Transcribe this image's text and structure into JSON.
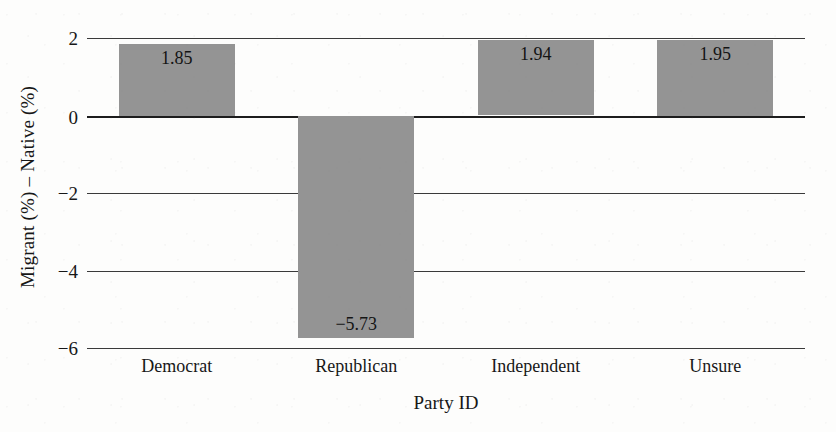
{
  "chart_data": {
    "type": "bar",
    "title": "",
    "xlabel": "Party ID",
    "ylabel": "Migrant (%) – Native (%)",
    "categories": [
      "Democrat",
      "Republican",
      "Independent",
      "Unsure"
    ],
    "values": [
      1.85,
      -5.73,
      1.94,
      1.95
    ],
    "value_labels": [
      "1.85",
      "−5.73",
      "1.94",
      "1.95"
    ],
    "ylim": [
      -6,
      2
    ],
    "yticks": [
      2,
      0,
      -2,
      -4,
      -6
    ],
    "ytick_labels": [
      "2",
      "0",
      "−2",
      "−4",
      "−6"
    ],
    "grid": true,
    "legend": "none",
    "bar_color": "#949494",
    "axis_color": "#3a3a3a",
    "background_color": "#fdfdfc"
  }
}
